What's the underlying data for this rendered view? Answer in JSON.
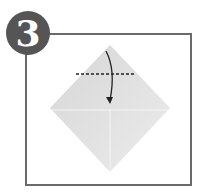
{
  "step": {
    "number": "3"
  },
  "diagram": {
    "paper_color": "#e3e3e3",
    "frame_color": "#6a6a6a",
    "badge_color": "#555555"
  }
}
